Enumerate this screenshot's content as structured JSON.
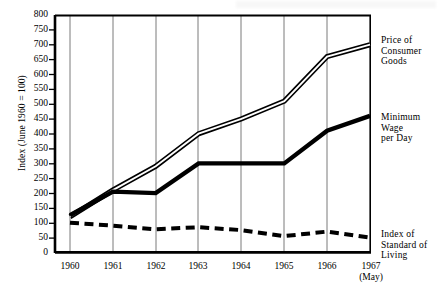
{
  "chart_data": {
    "type": "line",
    "title": "",
    "xlabel": "",
    "ylabel": "Index  (June  1960 = 100)",
    "x": [
      "1960",
      "1961",
      "1962",
      "1963",
      "1964",
      "1965",
      "1966",
      "1967"
    ],
    "x_tick_labels": [
      "1960",
      "1961",
      "1962",
      "1963",
      "1964",
      "1965",
      "1966",
      "1967"
    ],
    "x_tick_sublabel_last": "(May)",
    "ylim": [
      0,
      800
    ],
    "ytick_step": 50,
    "y_tick_labels": [
      "800",
      "750",
      "700",
      "650",
      "600",
      "550",
      "500",
      "450",
      "400",
      "350",
      "300",
      "250",
      "200",
      "150",
      "100",
      "50",
      "0"
    ],
    "grid": "vertical",
    "legend_position": "right-inline",
    "series": [
      {
        "name": "Price of Consumer Goods",
        "label_lines": [
          "Price of",
          "Consumer",
          "Goods"
        ],
        "style": "double-line",
        "values": [
          120,
          210,
          290,
          400,
          450,
          510,
          660,
          700
        ]
      },
      {
        "name": "Minimum Wage per Day",
        "label_lines": [
          "Minimum",
          "Wage",
          "per Day"
        ],
        "style": "thick-solid-step",
        "values": [
          125,
          205,
          200,
          300,
          300,
          300,
          410,
          460
        ]
      },
      {
        "name": "Index of Standard of Living",
        "label_lines": [
          "Index of",
          "Standard of",
          "Living"
        ],
        "style": "thick-dashed",
        "values": [
          100,
          90,
          78,
          85,
          75,
          55,
          70,
          50
        ]
      }
    ]
  },
  "axis": {
    "y_title": "Index  (June  1960 = 100)"
  },
  "labels": {
    "price_line1": "Price of",
    "price_line2": "Consumer",
    "price_line3": "Goods",
    "wage_line1": "Minimum",
    "wage_line2": "Wage",
    "wage_line3": "per Day",
    "living_line1": "Index of",
    "living_line2": "Standard of",
    "living_line3": "Living"
  },
  "xticks": {
    "t1960": "1960",
    "t1961": "1961",
    "t1962": "1962",
    "t1963": "1963",
    "t1964": "1964",
    "t1965": "1965",
    "t1966": "1966",
    "t1967": "1967",
    "t1967sub": "(May)"
  },
  "yticks": {
    "v800": "800",
    "v750": "750",
    "v700": "700",
    "v650": "650",
    "v600": "600",
    "v550": "550",
    "v500": "500",
    "v450": "450",
    "v400": "400",
    "v350": "350",
    "v300": "300",
    "v250": "250",
    "v200": "200",
    "v150": "150",
    "v100": "100",
    "v50": "50",
    "v0": "0"
  },
  "colors": {
    "ink": "#000000",
    "grid": "#6b6b6b",
    "background": "#ffffff"
  }
}
